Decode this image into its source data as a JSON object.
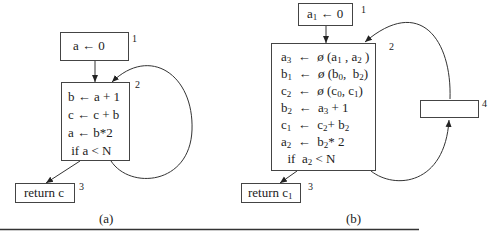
{
  "figure_a": {
    "caption": "(a)",
    "block1": {
      "number": "1",
      "lines": [
        "a ← 0"
      ]
    },
    "block2": {
      "number": "2",
      "lines": [
        "b ← a + 1",
        "c ← c + b",
        "a ← b*2",
        " if a < N"
      ]
    },
    "block3": {
      "number": "3",
      "lines": [
        "return c"
      ]
    }
  },
  "figure_b": {
    "caption": "(b)",
    "block1": {
      "number": "1",
      "lines": [
        {
          "v": "a",
          "s": "1",
          "rest": " ← 0"
        }
      ]
    },
    "block2": {
      "number": "2",
      "lines": [
        "a₃  ←  ø (a₁ , a₂ )",
        "b₁  ←  ø (b₀,  b₂)",
        "c₂  ←  ø (c₀, c₁)",
        "b₂  ←  a₃ + 1",
        "c₁  ←  c₂+ b₂",
        "a₂  ←  b₂* 2",
        "  if  a₂ < N"
      ]
    },
    "block3": {
      "number": "3",
      "lines": [
        "return c₁"
      ]
    },
    "block4": {
      "number": "4",
      "lines": []
    }
  }
}
